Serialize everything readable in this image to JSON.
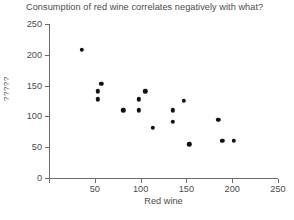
{
  "chart_data": {
    "type": "scatter",
    "title": "Consumption of red wine correlates negatively with what?",
    "xlabel": "Red wine",
    "ylabel": "?????",
    "xlim": [
      0,
      250
    ],
    "ylim": [
      0,
      250
    ],
    "grid": false,
    "legend": null,
    "x_ticks": [
      0,
      50,
      100,
      150,
      200,
      250
    ],
    "x_tick_labels": [
      "0",
      "50",
      "100",
      "150",
      "200",
      "250"
    ],
    "y_ticks": [
      0,
      50,
      100,
      150,
      200,
      250
    ],
    "y_tick_labels": [
      "0",
      "50",
      "100",
      "150",
      "200",
      "250"
    ],
    "x_tick_labels_visible": [
      "50",
      "100",
      "150",
      "200",
      "250"
    ],
    "marker_color": "#111111",
    "axis_color": "#6b6b6b",
    "points": [
      {
        "x": 36,
        "y": 208
      },
      {
        "x": 53,
        "y": 128
      },
      {
        "x": 53,
        "y": 141
      },
      {
        "x": 57,
        "y": 153
      },
      {
        "x": 81,
        "y": 110
      },
      {
        "x": 98,
        "y": 110
      },
      {
        "x": 98,
        "y": 128
      },
      {
        "x": 105,
        "y": 141
      },
      {
        "x": 113,
        "y": 81
      },
      {
        "x": 135,
        "y": 91
      },
      {
        "x": 135,
        "y": 110
      },
      {
        "x": 147,
        "y": 125
      },
      {
        "x": 153,
        "y": 55
      },
      {
        "x": 185,
        "y": 94
      },
      {
        "x": 189,
        "y": 60
      },
      {
        "x": 202,
        "y": 60
      }
    ]
  }
}
